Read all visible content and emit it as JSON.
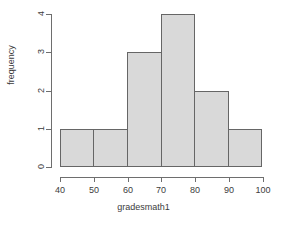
{
  "chart_data": {
    "type": "bar",
    "title": "",
    "subtitle": "",
    "xlabel": "gradesmath1",
    "ylabel": "frequency",
    "categories": [
      "40-50",
      "50-60",
      "60-70",
      "70-80",
      "80-90",
      "90-100"
    ],
    "bin_edges": [
      40,
      50,
      60,
      70,
      80,
      90,
      100
    ],
    "values": [
      1,
      1,
      3,
      4,
      2,
      1
    ],
    "xlim": [
      40,
      100
    ],
    "ylim": [
      0,
      4
    ],
    "x_ticks": [
      40,
      50,
      60,
      70,
      80,
      90,
      100
    ],
    "x_tick_labels": [
      "40",
      "50",
      "60",
      "70",
      "80",
      "90",
      "100"
    ],
    "y_ticks": [
      0,
      1,
      2,
      3,
      4
    ],
    "y_tick_labels": [
      "0",
      "1",
      "2",
      "3",
      "4"
    ],
    "grid": false,
    "legend": false,
    "legend_position": "none",
    "bar_fill_color": "#d9d9d9",
    "bar_border_color": "#666666",
    "axis_color": "#6e6e6e",
    "text_color": "#3c3c3c",
    "background_color": "#ffffff"
  },
  "axes": {
    "x_title": "gradesmath1",
    "y_title": "frequency",
    "x_tick_labels": [
      "40",
      "50",
      "60",
      "70",
      "80",
      "90",
      "100"
    ],
    "y_tick_labels": [
      "0",
      "1",
      "2",
      "3",
      "4"
    ]
  }
}
